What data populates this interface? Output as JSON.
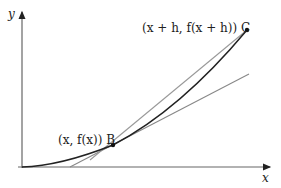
{
  "diagram": {
    "axes": {
      "x_label": "x",
      "y_label": "y"
    },
    "points": {
      "B": {
        "label": "(x, f(x)) B",
        "coord_text": "(x, f(x))",
        "name": "B"
      },
      "C": {
        "label": "(x + h, f(x + h)) C",
        "coord_text": "(x + h, f(x + h))",
        "name": "C"
      }
    },
    "lines": {
      "curve": "f(x)",
      "secant": "BC",
      "tangent": "at B"
    },
    "colors": {
      "curve": "#222222",
      "secant": "#888888",
      "tangent": "#888888",
      "axes": "#555555"
    }
  }
}
